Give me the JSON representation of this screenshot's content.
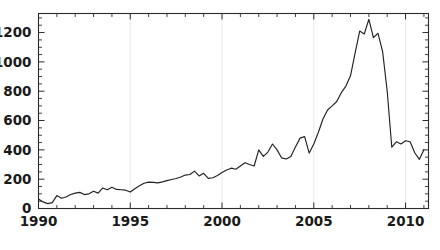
{
  "figure": {
    "background_color": "#ffffff",
    "line_color": "#222222",
    "axis_color": "#2b2b2b",
    "gridline_color": "#ededed"
  },
  "chart_data": {
    "type": "line",
    "title": "",
    "subtitle": "",
    "xlabel": "",
    "ylabel": "",
    "xlim": [
      1990,
      2011.25
    ],
    "ylim": [
      0,
      1330
    ],
    "grid": "vertical-only",
    "legend": "none",
    "x_ticks_major": [
      1990,
      1995,
      2000,
      2005,
      2010
    ],
    "x_tick_labels": [
      "1990",
      "1995",
      "2000",
      "2005",
      "2010"
    ],
    "x_minor_tick_interval": 1,
    "y_ticks_major": [
      0,
      200,
      400,
      600,
      800,
      1000,
      1200
    ],
    "y_tick_labels": [
      "0",
      "200",
      "400",
      "600",
      "800",
      "1000",
      "1200"
    ],
    "y_minor_tick_interval": 50,
    "series": [
      {
        "name": "series-1",
        "color": "#222222",
        "x": [
          1990.0,
          1990.25,
          1990.5,
          1990.75,
          1991.0,
          1991.25,
          1991.5,
          1991.75,
          1992.0,
          1992.25,
          1992.5,
          1992.75,
          1993.0,
          1993.25,
          1993.5,
          1993.75,
          1994.0,
          1994.25,
          1994.5,
          1994.75,
          1995.0,
          1995.25,
          1995.5,
          1995.75,
          1996.0,
          1996.25,
          1996.5,
          1996.75,
          1997.0,
          1997.25,
          1997.5,
          1997.75,
          1998.0,
          1998.25,
          1998.5,
          1998.75,
          1999.0,
          1999.25,
          1999.5,
          1999.75,
          2000.0,
          2000.25,
          2000.5,
          2000.75,
          2001.0,
          2001.25,
          2001.5,
          2001.75,
          2002.0,
          2002.25,
          2002.5,
          2002.75,
          2003.0,
          2003.25,
          2003.5,
          2003.75,
          2004.0,
          2004.25,
          2004.5,
          2004.75,
          2005.0,
          2005.25,
          2005.5,
          2005.75,
          2006.0,
          2006.25,
          2006.5,
          2006.75,
          2007.0,
          2007.25,
          2007.5,
          2007.75,
          2008.0,
          2008.25,
          2008.5,
          2008.75,
          2009.0,
          2009.25,
          2009.5,
          2009.75,
          2010.0,
          2010.25,
          2010.5,
          2010.75,
          2011.0
        ],
        "values": [
          65,
          45,
          33,
          40,
          88,
          70,
          78,
          95,
          105,
          110,
          95,
          100,
          118,
          105,
          140,
          128,
          145,
          130,
          128,
          125,
          112,
          135,
          155,
          172,
          180,
          178,
          175,
          182,
          190,
          198,
          205,
          215,
          228,
          232,
          255,
          222,
          240,
          205,
          210,
          225,
          245,
          262,
          275,
          268,
          290,
          312,
          300,
          290,
          400,
          355,
          385,
          440,
          400,
          345,
          338,
          355,
          420,
          480,
          490,
          378,
          440,
          520,
          610,
          672,
          700,
          730,
          790,
          835,
          905,
          1060,
          1210,
          1190,
          1290,
          1165,
          1195,
          1070,
          800,
          418,
          455,
          440,
          462,
          455,
          380,
          335,
          400
        ]
      }
    ]
  }
}
